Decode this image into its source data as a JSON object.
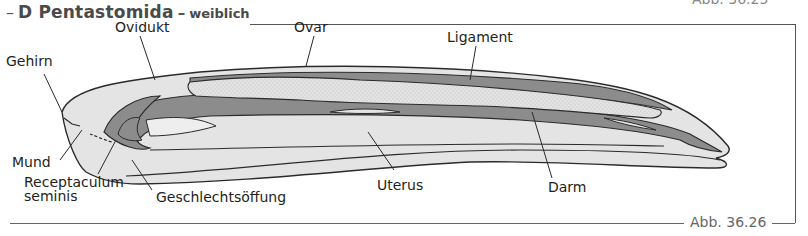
{
  "header": {
    "dash": "–",
    "section_letter_title": "D Pentastomida",
    "separator": "–",
    "subtitle": "weiblich"
  },
  "figure": {
    "number": "Abb. 36.26",
    "previous_number_cut": "Abb. 36.25"
  },
  "labels": {
    "gehirn": "Gehirn",
    "ovidukt": "Ovidukt",
    "ovar": "Ovar",
    "ligament": "Ligament",
    "mund": "Mund",
    "receptaculum_line1": "Receptaculum",
    "receptaculum_line2": "seminis",
    "geschlechtsoeffnung": "Geschlechtsöffung",
    "uterus": "Uterus",
    "darm": "Darm"
  },
  "colors": {
    "outline": "#2b2b2b",
    "body_fill": "#e4e4e4",
    "organ_dark": "#8c8c8c",
    "ovary_fill": "#d2d2d2",
    "frame": "#555555"
  }
}
